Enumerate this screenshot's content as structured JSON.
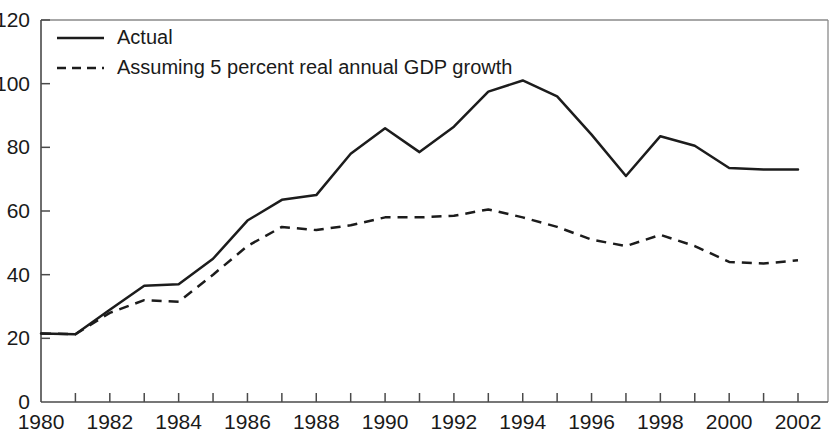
{
  "chart_data": {
    "type": "line",
    "title": "",
    "subtitle": "",
    "xlabel": "",
    "ylabel": "",
    "xlim": [
      1980,
      2002
    ],
    "ylim": [
      0,
      120
    ],
    "grid": false,
    "legend_position": "top-left",
    "y_ticks": [
      0,
      20,
      40,
      60,
      80,
      100,
      120
    ],
    "y_tick_labels": [
      "0",
      "20",
      "40",
      "60",
      "80",
      "100",
      "120"
    ],
    "x_ticks": [
      1980,
      1981,
      1982,
      1983,
      1984,
      1985,
      1986,
      1987,
      1988,
      1989,
      1990,
      1991,
      1992,
      1993,
      1994,
      1995,
      1996,
      1997,
      1998,
      1999,
      2000,
      2001,
      2002
    ],
    "x_tick_labels_shown": [
      "1980",
      "1982",
      "1984",
      "1986",
      "1988",
      "1990",
      "1992",
      "1994",
      "1996",
      "1998",
      "2000",
      "2002"
    ],
    "x": [
      1980,
      1981,
      1982,
      1983,
      1984,
      1985,
      1986,
      1987,
      1988,
      1989,
      1990,
      1991,
      1992,
      1993,
      1994,
      1995,
      1996,
      1997,
      1998,
      1999,
      2000,
      2001,
      2002
    ],
    "series": [
      {
        "name": "Actual",
        "style": "solid",
        "color": "#1c1c1c",
        "values": [
          21.5,
          21.3,
          29.0,
          36.5,
          37.0,
          45.0,
          57.0,
          63.5,
          65.0,
          78.0,
          86.0,
          78.5,
          86.5,
          97.5,
          101.0,
          96.0,
          84.0,
          71.0,
          83.5,
          80.5,
          73.5,
          73.0,
          73.0
        ]
      },
      {
        "name": "Assuming 5 percent real annual GDP growth",
        "style": "dashed",
        "color": "#1c1c1c",
        "values": [
          21.5,
          21.3,
          28.0,
          32.0,
          31.5,
          40.0,
          49.0,
          55.0,
          54.0,
          55.5,
          58.0,
          58.0,
          58.5,
          60.5,
          58.0,
          55.0,
          51.0,
          49.0,
          52.5,
          49.0,
          44.0,
          43.5,
          44.5
        ]
      }
    ],
    "legend": [
      {
        "label": "Actual",
        "style": "solid"
      },
      {
        "label": "Assuming 5 percent real annual GDP growth",
        "style": "dashed"
      }
    ]
  }
}
